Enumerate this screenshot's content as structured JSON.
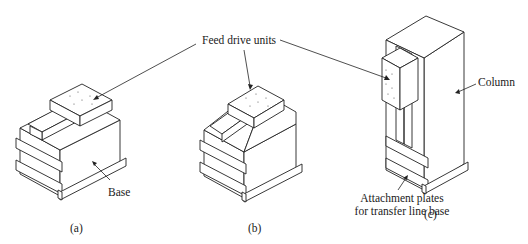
{
  "figure": {
    "labels": {
      "feed_drive_units": "Feed drive units",
      "base": "Base",
      "column": "Column",
      "attachment_line1": "Attachment plates",
      "attachment_line2": "for transfer line base"
    },
    "captions": {
      "a": "(a)",
      "b": "(b)",
      "c": "(c)"
    },
    "parts": [
      {
        "id": "a",
        "name": "horizontal-base",
        "has_feed_unit": true
      },
      {
        "id": "b",
        "name": "angled-base",
        "has_feed_unit": true
      },
      {
        "id": "c",
        "name": "vertical-column",
        "has_feed_unit": true
      }
    ],
    "colors": {
      "line": "#222222",
      "background": "#ffffff",
      "text": "#1a1a1a"
    }
  }
}
